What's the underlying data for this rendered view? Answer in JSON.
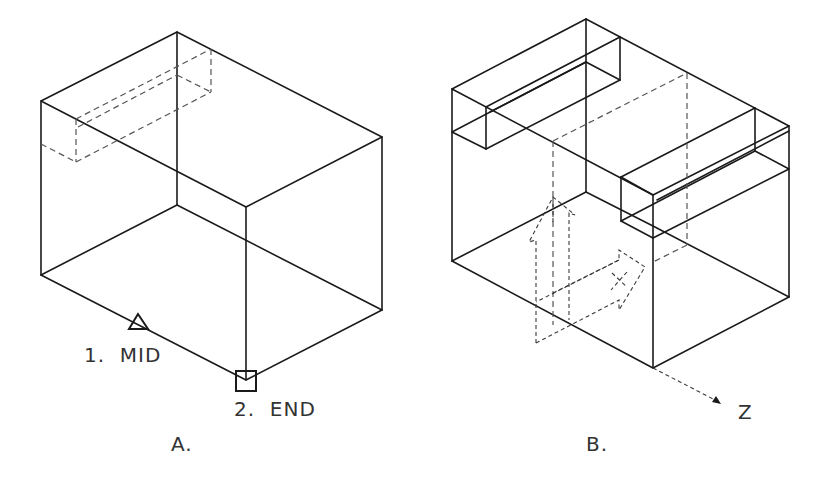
{
  "figures": [
    {
      "id": "A",
      "caption": "A.",
      "description": "Wireframe isometric box with hidden (dashed) rectangular slot near top-left back",
      "snap_points": [
        {
          "number": "1.",
          "label": "MID",
          "marker": "triangle",
          "full_text": "1.  MID"
        },
        {
          "number": "2.",
          "label": "END",
          "marker": "square",
          "full_text": "2.  END"
        }
      ]
    },
    {
      "id": "B",
      "caption": "B.",
      "description": "Wireframe isometric box with two rectangular notches on top edges and dashed UCS icon",
      "axis_label": "Z"
    }
  ],
  "colors": {
    "line": "#1a1a1a",
    "hidden_line": "#555555",
    "text": "#333333",
    "background": "#ffffff"
  }
}
